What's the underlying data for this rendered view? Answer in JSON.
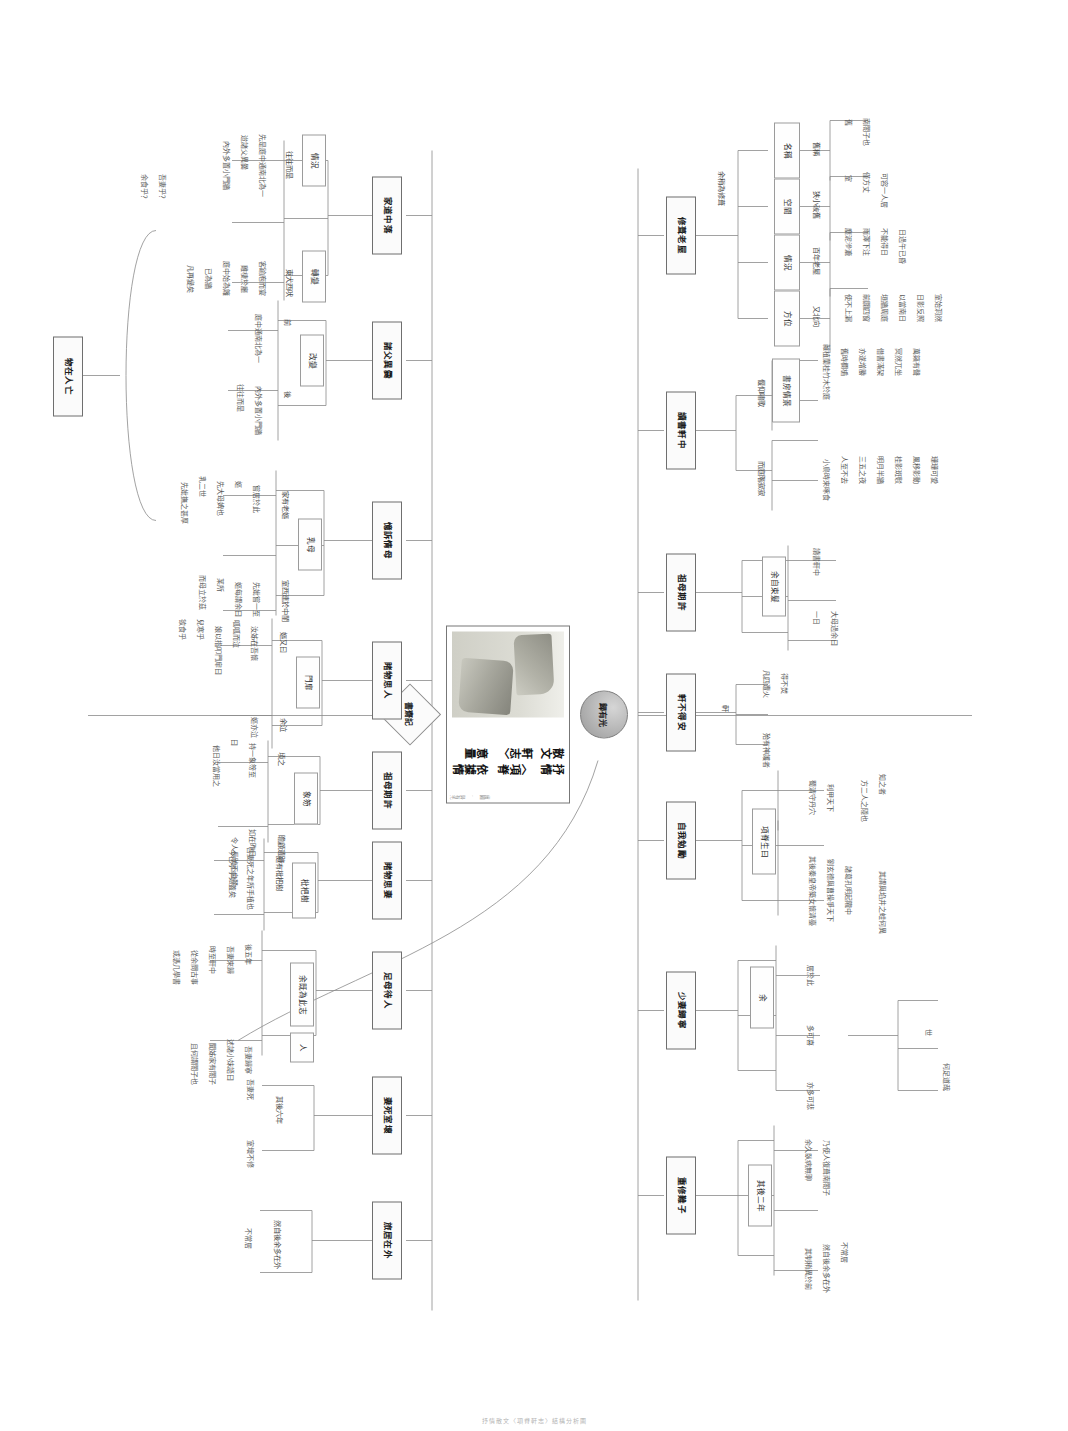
{
  "diagram": {
    "type": "mind-map",
    "orientation": "rotated-90-clockwise",
    "center": {
      "title_line1": "抒情散文",
      "title_line2": "〈項脊軒志〉",
      "title_line3": "依據情意量",
      "credit": "繪圖 · 歸有光"
    },
    "hub_top_label": "歸有光",
    "hub_bottom_label": "書齋記",
    "footer": "抒情散文〈項脊軒志〉結構分析圖"
  },
  "upper": {
    "branches": [
      {
        "id": "xiu-qi-lao-wu",
        "label": "修葺老屋",
        "groups": [
          {
            "label": "名稱",
            "connector": "舊稱",
            "leaves": [
              "舊",
              "南閤子也"
            ]
          },
          {
            "label": "空間",
            "connector": "狹小破舊",
            "leaves": [
              "室",
              "僅方丈",
              "可容一人居"
            ]
          },
          {
            "label": "情況",
            "connector": "百年老屋",
            "leaves": [
              "塵泥滲漉",
              "雨澤下注",
              "不能得日",
              "日過午已昏"
            ]
          },
          {
            "label": "方位",
            "connector": "又北向",
            "leaves": [
              "使不上漏",
              "前闢四窗",
              "垣牆周庭",
              "以當南日",
              "日影反照",
              "室始洞然"
            ]
          }
        ]
      },
      {
        "id": "du-shu-xuan-zhong",
        "label": "讀書軒中",
        "groups": [
          {
            "label": "書房情景",
            "connector": "偃仰嘯歌",
            "leaves": [
              "雜植蘭桂竹木於庭",
              "舊時欄楯",
              "亦遂增勝",
              "借書滿架",
              "冥然兀坐",
              "萬籟有聲"
            ]
          },
          {
            "label": "",
            "connector": "而庭階寂寂",
            "leaves": [
              "小鳥時來啄食",
              "人至不去",
              "三五之夜",
              "明月半牆",
              "桂影斑駁",
              "風移影動",
              "珊珊可愛"
            ]
          }
        ]
      },
      {
        "id": "zu-mu-qi-xu-upper",
        "label": "祖母期許",
        "groups": [
          {
            "label": "",
            "connector": "余自束髮",
            "leaves": [
              "讀書軒中",
              "一日",
              "大母過余曰"
            ]
          }
        ]
      },
      {
        "id": "xuan-bu-de-an",
        "label": "軒不得安",
        "groups": [
          {
            "label": "",
            "connector": "軒",
            "leaves": [
              "凡四遭火",
              "得不焚",
              "殆有神護者"
            ]
          }
        ]
      },
      {
        "id": "zi-wo-mian-li",
        "label": "自我勉勵",
        "groups": [
          {
            "label": "",
            "connector": "項脊生曰",
            "leaves": [
              "蜀清守丹穴",
              "利甲天下",
              "其後秦皇帝築女懷清臺",
              "劉玄德與曹操爭天下",
              "諸葛孔明起隴中"
            ]
          }
        ]
      },
      {
        "id": "shao-qi-shi-chuang",
        "label": "少妻歸寧",
        "groups": [
          {
            "label": "",
            "connector": "余",
            "leaves": [
              "居於此",
              "多可喜",
              "亦多可悲"
            ]
          }
        ]
      },
      {
        "id": "zhong-xiu-nan-ge",
        "label": "重修難子",
        "groups": [
          {
            "label": "",
            "connector": "其後二年",
            "leaves": [
              "余久臥病無聊",
              "乃使人復葺南閤子",
              "其制稍異於前",
              "然自後余多在外",
              "不常居"
            ]
          }
        ]
      }
    ]
  },
  "lower": {
    "root": "物在人亡",
    "branches": [
      {
        "id": "jia-dao-zhong-luo",
        "label": "家道中落",
        "groups": [
          {
            "label": "情況",
            "connector": "往往而是",
            "leaves": [
              "先是庭中通南北為一",
              "迨諸父異爨",
              "內外多置小門牆"
            ]
          },
          {
            "label": "轉變",
            "connector": "東犬西吠",
            "leaves": [
              "客踰庖而宴",
              "雞棲於廳",
              "庭中始為籬",
              "已為牆",
              "凡再變矣"
            ]
          }
        ]
      },
      {
        "id": "zhu-fu-yi-cuan",
        "label": "諸父異爨",
        "groups": [
          {
            "label": "改變",
            "connector": "前",
            "leaves": [
              "庭中通南北為一"
            ]
          },
          {
            "label": "",
            "connector": "後",
            "leaves": [
              "內外多置小門牆",
              "往往而是"
            ]
          }
        ]
      },
      {
        "id": "yi-su-qing-mu",
        "label": "憶訴情母",
        "groups": [
          {
            "label": "乳母",
            "connector": "家有老嫗",
            "leaves": [
              "嘗居於此",
              "嫗",
              "先大母婢也",
              "乳二世",
              "先妣撫之甚厚"
            ]
          },
          {
            "label": "",
            "connector": "室西連於中閨",
            "leaves": [
              "先妣嘗一至",
              "嫗每謂余曰",
              "某所",
              "而母立於茲"
            ]
          }
        ]
      },
      {
        "id": "du-wu-si-ren",
        "label": "睹物思人",
        "groups": [
          {
            "label": "門扉",
            "connector": "嫗又曰",
            "leaves": [
              "汝姊在吾懷",
              "呱呱而泣",
              "娘以指叩門扉曰",
              "兒寒乎",
              "欲食乎"
            ]
          },
          {
            "label": "",
            "connector": "余泣",
            "leaves": [
              "嫗亦泣"
            ]
          }
        ]
      },
      {
        "id": "zu-mu-qi-xu-lower",
        "label": "祖母期許",
        "groups": [
          {
            "label": "象笏",
            "connector": "頃之",
            "leaves": [
              "持一象笏至",
              "曰",
              "他日汝當用之"
            ]
          },
          {
            "label": "",
            "connector": "瞻顧遺跡",
            "leaves": [
              "如在昨日",
              "令人長號不自禁"
            ]
          }
        ]
      },
      {
        "id": "du-wu-si-qi",
        "label": "睹物思妻",
        "groups": [
          {
            "label": "枇杷樹",
            "connector": "庭有枇杷樹",
            "leaves": [
              "吾妻死之年所手植也",
              "今已亭亭如蓋矣"
            ]
          }
        ]
      },
      {
        "id": "zu-mu-qi-ren",
        "label": "足母待人",
        "groups": [
          {
            "label": "",
            "connector": "余既為此志",
            "leaves": [
              "後五年",
              "吾妻來歸",
              "時至軒中",
              "從余問古事",
              "或憑几學書"
            ]
          },
          {
            "label": "人",
            "connector": "吾妻歸寧",
            "leaves": [
              "述諸小妹語曰",
              "聞姊家有閤子",
              "且何謂閤子也"
            ]
          }
        ]
      },
      {
        "id": "qi-si-shi-huai",
        "label": "妻死室壞",
        "groups": [
          {
            "label": "",
            "connector": "其後六年",
            "leaves": [
              "吾妻死",
              "室壞不修"
            ]
          }
        ]
      },
      {
        "id": "ju-ju-zai-wai",
        "label": "旅居在外",
        "groups": [
          {
            "label": "",
            "connector": "然自後余多在外",
            "leaves": [
              "不常居"
            ]
          }
        ]
      }
    ]
  },
  "loose_labels": {
    "upper_spine_left": [
      "詳略有",
      "余稍為修葺",
      "使不上漏"
    ],
    "lower_spine_left": [
      "吾妻乎？",
      "余食乎？"
    ],
    "misc": [
      "世",
      "何足道哉",
      "知之者",
      "其謂與埳井之蛙何異",
      "方二人之隱也"
    ]
  }
}
